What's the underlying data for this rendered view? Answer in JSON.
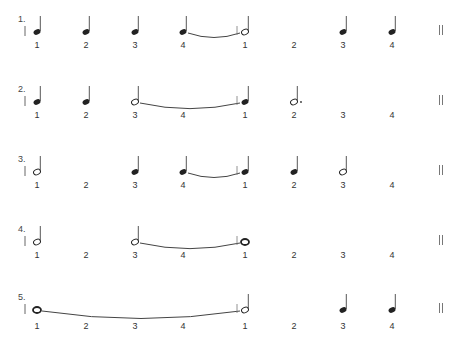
{
  "exercises": [
    {
      "number": "1.",
      "counts": [
        "1",
        "2",
        "3",
        "4",
        "1",
        "2",
        "3",
        "4"
      ],
      "notes": [
        {
          "type": "quarter",
          "beat": 1
        },
        {
          "type": "quarter",
          "beat": 2
        },
        {
          "type": "quarter",
          "beat": 3
        },
        {
          "type": "quarter",
          "beat": 4,
          "tie_to_next": true
        },
        {
          "type": "half",
          "beat": 5
        },
        {
          "type": "quarter",
          "beat": 7
        },
        {
          "type": "quarter",
          "beat": 8
        }
      ]
    },
    {
      "number": "2.",
      "counts": [
        "1",
        "2",
        "3",
        "4",
        "1",
        "2",
        "3",
        "4"
      ],
      "notes": [
        {
          "type": "quarter",
          "beat": 1
        },
        {
          "type": "quarter",
          "beat": 2
        },
        {
          "type": "half",
          "beat": 3,
          "tie_to_next": true
        },
        {
          "type": "quarter",
          "beat": 5
        },
        {
          "type": "dotted-half",
          "beat": 6
        }
      ]
    },
    {
      "number": "3.",
      "counts": [
        "1",
        "2",
        "3",
        "4",
        "1",
        "2",
        "3",
        "4"
      ],
      "notes": [
        {
          "type": "half",
          "beat": 1
        },
        {
          "type": "quarter",
          "beat": 3
        },
        {
          "type": "quarter",
          "beat": 4,
          "tie_to_next": true
        },
        {
          "type": "quarter",
          "beat": 5
        },
        {
          "type": "quarter",
          "beat": 6
        },
        {
          "type": "half",
          "beat": 7
        }
      ]
    },
    {
      "number": "4.",
      "counts": [
        "1",
        "2",
        "3",
        "4",
        "1",
        "2",
        "3",
        "4"
      ],
      "notes": [
        {
          "type": "half",
          "beat": 1
        },
        {
          "type": "half",
          "beat": 3,
          "tie_to_next": true
        },
        {
          "type": "whole",
          "beat": 5
        }
      ]
    },
    {
      "number": "5.",
      "counts": [
        "1",
        "2",
        "3",
        "4",
        "1",
        "2",
        "3",
        "4"
      ],
      "notes": [
        {
          "type": "whole",
          "beat": 1,
          "tie_to_next": true
        },
        {
          "type": "half",
          "beat": 5
        },
        {
          "type": "quarter",
          "beat": 7
        },
        {
          "type": "quarter",
          "beat": 8
        }
      ]
    }
  ],
  "end_symbol": "double-barline"
}
